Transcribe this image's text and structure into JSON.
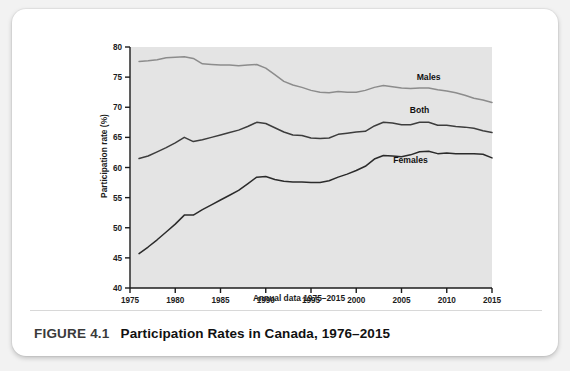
{
  "figure": {
    "number": "FIGURE 4.1",
    "title": "Participation Rates in Canada, 1976–2015"
  },
  "chart_data": {
    "type": "line",
    "title": "",
    "xlabel": "Annual data 1975–2015",
    "ylabel": "Participation rate (%)",
    "xlim": [
      1975,
      2015
    ],
    "ylim": [
      40,
      80
    ],
    "xticks": [
      "1975",
      "1980",
      "1985",
      "1990",
      "1995",
      "2000",
      "2005",
      "2010",
      "2015"
    ],
    "yticks": [
      "40",
      "45",
      "50",
      "55",
      "60",
      "65",
      "70",
      "75",
      "80"
    ],
    "grid": false,
    "legend": "inline-annotations",
    "plot_background": "#e4e4e4",
    "x": [
      1976,
      1977,
      1978,
      1979,
      1980,
      1981,
      1982,
      1983,
      1984,
      1985,
      1986,
      1987,
      1988,
      1989,
      1990,
      1991,
      1992,
      1993,
      1994,
      1995,
      1996,
      1997,
      1998,
      1999,
      2000,
      2001,
      2002,
      2003,
      2004,
      2005,
      2006,
      2007,
      2008,
      2009,
      2010,
      2011,
      2012,
      2013,
      2014,
      2015
    ],
    "series": [
      {
        "name": "Males",
        "color": "#8c8c8c",
        "label_x": 2008,
        "label_y": 74.6,
        "values": [
          77.6,
          77.7,
          77.9,
          78.2,
          78.3,
          78.4,
          78.1,
          77.2,
          77.1,
          77.0,
          77.0,
          76.9,
          77.0,
          77.1,
          76.5,
          75.4,
          74.3,
          73.7,
          73.3,
          72.8,
          72.5,
          72.4,
          72.6,
          72.5,
          72.5,
          72.8,
          73.3,
          73.6,
          73.4,
          73.2,
          73.1,
          73.2,
          73.2,
          72.9,
          72.7,
          72.4,
          72.0,
          71.5,
          71.2,
          70.8
        ]
      },
      {
        "name": "Both",
        "color": "#3d3d3d",
        "label_x": 2007,
        "label_y": 69.1,
        "values": [
          61.5,
          61.9,
          62.6,
          63.3,
          64.1,
          65.0,
          64.3,
          64.6,
          65.0,
          65.4,
          65.8,
          66.2,
          66.8,
          67.5,
          67.3,
          66.6,
          65.9,
          65.4,
          65.3,
          64.9,
          64.8,
          64.9,
          65.5,
          65.7,
          65.9,
          66.0,
          66.9,
          67.5,
          67.4,
          67.1,
          67.1,
          67.5,
          67.5,
          67.0,
          67.0,
          66.8,
          66.7,
          66.5,
          66.1,
          65.8
        ]
      },
      {
        "name": "Females",
        "color": "#2b2b2b",
        "label_x": 2006,
        "label_y": 60.7,
        "values": [
          45.7,
          46.8,
          48.0,
          49.3,
          50.6,
          52.1,
          52.1,
          53.0,
          53.8,
          54.6,
          55.4,
          56.2,
          57.3,
          58.4,
          58.5,
          58.0,
          57.7,
          57.6,
          57.6,
          57.5,
          57.5,
          57.8,
          58.4,
          58.9,
          59.5,
          60.2,
          61.4,
          62.0,
          61.9,
          61.8,
          62.1,
          62.6,
          62.7,
          62.3,
          62.4,
          62.3,
          62.3,
          62.3,
          62.2,
          61.6
        ]
      }
    ]
  }
}
